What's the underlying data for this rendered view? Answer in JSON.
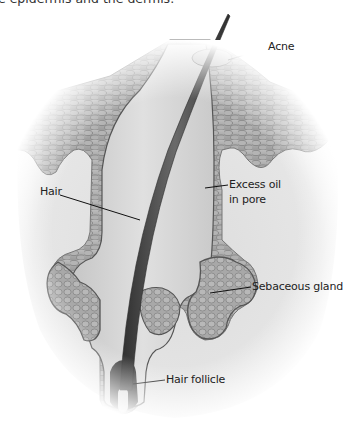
{
  "figure": {
    "caption_fragment": "e epidermis and the dermis.",
    "palette": {
      "background": "#ffffff",
      "dermis": "#e4e4e4",
      "epidermis": "#a9a9a9",
      "cell_outline": "#6e6e6e",
      "pore_fill": "#d2d2d2",
      "hair": "#4a4a4a",
      "leader_line": "#111111",
      "label_text": "#222222"
    }
  },
  "labels": [
    {
      "id": "acne",
      "text": "Acne"
    },
    {
      "id": "hair",
      "text": "Hair"
    },
    {
      "id": "excess-oil",
      "text": "Excess oil",
      "text2": "in pore"
    },
    {
      "id": "sebaceous-gland",
      "text": "Sebaceous gland"
    },
    {
      "id": "hair-follicle",
      "text": "Hair follicle"
    }
  ]
}
